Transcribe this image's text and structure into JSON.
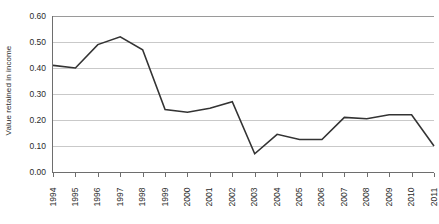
{
  "chart_data": {
    "type": "line",
    "title": "",
    "xlabel": "",
    "ylabel": "Value retained in income",
    "ylim": [
      0.0,
      0.6
    ],
    "yticks": [
      "0.00",
      "0.10",
      "0.20",
      "0.30",
      "0.40",
      "0.50",
      "0.60"
    ],
    "ytick_values": [
      0.0,
      0.1,
      0.2,
      0.3,
      0.4,
      0.5,
      0.6
    ],
    "grid": "horizontal",
    "legend": "none",
    "categories": [
      "1994",
      "1995",
      "1996",
      "1997",
      "1998",
      "1999",
      "2000",
      "2001",
      "2002",
      "2003",
      "2004",
      "2005",
      "2006",
      "2007",
      "2008",
      "2009",
      "2010",
      "2011"
    ],
    "values": [
      0.41,
      0.4,
      0.49,
      0.52,
      0.47,
      0.24,
      0.23,
      0.245,
      0.27,
      0.07,
      0.145,
      0.125,
      0.125,
      0.21,
      0.205,
      0.22,
      0.22,
      0.1
    ],
    "series": [
      {
        "name": "Value retained in income",
        "color": "#333333",
        "values": [
          0.41,
          0.4,
          0.49,
          0.52,
          0.47,
          0.24,
          0.23,
          0.245,
          0.27,
          0.07,
          0.145,
          0.125,
          0.125,
          0.21,
          0.205,
          0.22,
          0.22,
          0.1
        ]
      }
    ]
  },
  "style": {
    "line_color": "#333333",
    "grid_color": "#c9c9c9",
    "axis_color": "#6e6e6e",
    "text_color": "#2b2b2b",
    "background": "#ffffff"
  }
}
